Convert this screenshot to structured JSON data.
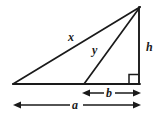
{
  "figure": {
    "type": "geometry-diagram",
    "background_color": "#ffffff",
    "stroke_color": "#1a1a1a",
    "labels": {
      "hypotenuse_outer": "x",
      "cevian": "y",
      "vertical_leg": "h",
      "short_base_segment": "b",
      "full_base": "a"
    },
    "markers": {
      "right_angle": "right-angle-square"
    },
    "geometry": {
      "apex": [
        140,
        7
      ],
      "left_vertex": [
        13,
        84
      ],
      "right_vertex": [
        139,
        84
      ],
      "cevian_foot": [
        84,
        84
      ],
      "right_angle_square": [
        129,
        74,
        10,
        10
      ],
      "dimension_b": {
        "x1": 83,
        "x2": 140,
        "y": 93
      },
      "dimension_a": {
        "x1": 14,
        "x2": 140,
        "y": 105
      }
    }
  }
}
